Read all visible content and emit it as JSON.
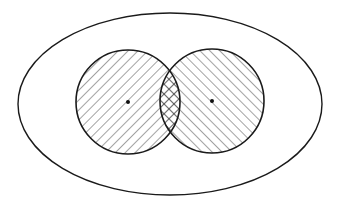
{
  "diagram": {
    "title": "Venn diagram: two overlapping sets within a universal set",
    "colors": {
      "background": "#ffffff",
      "stroke": "#1a1a1a",
      "hatch": "#333333"
    },
    "universe": {
      "shape": "ellipse",
      "cx": 170,
      "cy": 104,
      "rx": 152,
      "ry": 91
    },
    "sets": [
      {
        "id": "A",
        "cx": 128,
        "cy": 102,
        "r": 52,
        "hatch": "forward-diagonal",
        "center_dot": true
      },
      {
        "id": "B",
        "cx": 212,
        "cy": 101,
        "r": 52,
        "hatch": "backward-diagonal",
        "center_dot": true
      }
    ],
    "intersection": {
      "hatch": "cross-hatch"
    },
    "hatch_spacing": 7
  }
}
